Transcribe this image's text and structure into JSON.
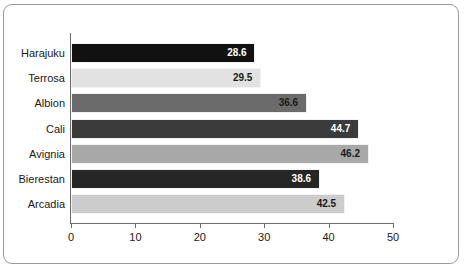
{
  "chart_data": {
    "type": "bar",
    "orientation": "horizontal",
    "title": "",
    "xlabel": "",
    "ylabel": "",
    "xlim": [
      0,
      50
    ],
    "xticks": [
      "0",
      "10",
      "20",
      "30",
      "40",
      "50"
    ],
    "grid": false,
    "legend": false,
    "categories": [
      "Harajuku",
      "Terrosa",
      "Albion",
      "Cali",
      "Avignia",
      "Bierestan",
      "Arcadia"
    ],
    "values": [
      28.6,
      29.5,
      36.6,
      44.7,
      46.2,
      38.6,
      42.5
    ],
    "value_labels": [
      "28.6",
      "29.5",
      "36.6",
      "44.7",
      "46.2",
      "38.6",
      "42.5"
    ],
    "bar_colors": [
      "#111111",
      "#e2e2e2",
      "#6b6b6b",
      "#3b3b3b",
      "#a8a8a8",
      "#262626",
      "#cccccc"
    ],
    "label_colors": [
      "#ffffff",
      "#1a1a1a",
      "#1a1a1a",
      "#ffffff",
      "#1a1a1a",
      "#ffffff",
      "#1a1a1a"
    ],
    "bars": [
      {
        "category": "Harajuku",
        "value": 28.6,
        "label": "28.6",
        "color": "#111111",
        "label_color": "#ffffff"
      },
      {
        "category": "Terrosa",
        "value": 29.5,
        "label": "29.5",
        "color": "#e2e2e2",
        "label_color": "#1a1a1a"
      },
      {
        "category": "Albion",
        "value": 36.6,
        "label": "36.6",
        "color": "#6b6b6b",
        "label_color": "#1a1a1a"
      },
      {
        "category": "Cali",
        "value": 44.7,
        "label": "44.7",
        "color": "#3b3b3b",
        "label_color": "#ffffff"
      },
      {
        "category": "Avignia",
        "value": 46.2,
        "label": "46.2",
        "color": "#a8a8a8",
        "label_color": "#1a1a1a"
      },
      {
        "category": "Bierestan",
        "value": 38.6,
        "label": "38.6",
        "color": "#262626",
        "label_color": "#ffffff"
      },
      {
        "category": "Arcadia",
        "value": 42.5,
        "label": "42.5",
        "color": "#cccccc",
        "label_color": "#1a1a1a"
      }
    ],
    "frame_color": "#9a9a9a",
    "axis_color": "#6e6e6e",
    "background_color": "#ffffff"
  }
}
